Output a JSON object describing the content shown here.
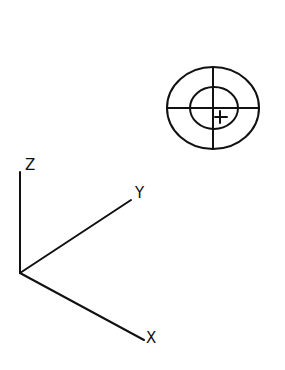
{
  "diagram": {
    "target": {
      "center": [
        213,
        108
      ],
      "outer": {
        "rx": 46,
        "ry": 41
      },
      "inner": {
        "cx": 214,
        "cy": 108,
        "rx": 24,
        "ry": 21
      },
      "marker": {
        "cx": 220,
        "cy": 117,
        "size": 8
      }
    },
    "axes": {
      "origin": [
        20,
        273
      ],
      "z": {
        "label": "Z",
        "end": [
          20,
          172
        ]
      },
      "y": {
        "label": "Y",
        "end": [
          131,
          200
        ]
      },
      "x": {
        "label": "X",
        "end": [
          144,
          340
        ]
      }
    },
    "colors": {
      "stroke": "#111111",
      "background": "#ffffff"
    }
  }
}
